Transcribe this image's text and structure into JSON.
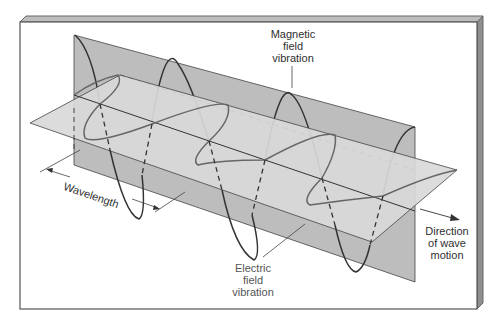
{
  "figure": {
    "labels": {
      "magnetic": [
        "Magnetic",
        "field",
        "vibration"
      ],
      "electric": [
        "Electric",
        "field",
        "vibration"
      ],
      "direction": [
        "Direction",
        "of wave",
        "motion"
      ],
      "wavelength": "Wavelength"
    },
    "colors": {
      "frame_border": "#555555",
      "frame_bevel": "#9a9a9a",
      "vertical_plane": "#bdbdbd",
      "horizontal_plane": "#d9d9d9",
      "magnetic_wave": "#333333",
      "electric_wave": "#666666"
    }
  }
}
